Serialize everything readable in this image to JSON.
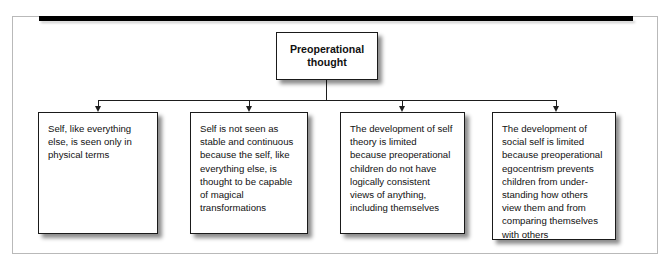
{
  "figure": {
    "clipped_caption": "p             g             p",
    "frame_color": "#b9b9b9",
    "rule_color": "#000000",
    "line_color": "#1d1d1d",
    "box_border_color": "#1a1a1a",
    "box_fill": "#ffffff",
    "text_color": "#111111"
  },
  "diagram": {
    "type": "hierarchy-tree",
    "root": {
      "label": "Preoperational\nthought"
    },
    "children": [
      {
        "index": 0,
        "label": "Self, like everything else, is seen only in physical terms"
      },
      {
        "index": 1,
        "label": "Self is not seen as stable and continuous because the self, like everything else, is thought to be capable of magical transformations"
      },
      {
        "index": 2,
        "label": "The development of self theory is limited because preoperational children do not have logically consistent views of anything, including themselves"
      },
      {
        "index": 3,
        "label": "The development of social self is limited because preoperational egocentrism prevents children from under-standing how others view them and from comparing themselves with others"
      }
    ]
  }
}
